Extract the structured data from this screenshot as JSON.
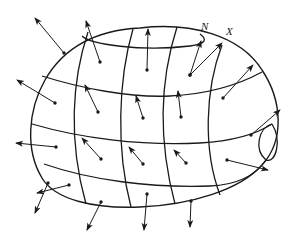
{
  "figure": {
    "type": "surface-normal-field",
    "stroke_color": "#1a1a1a",
    "background": "#ffffff"
  },
  "labels": {
    "normal": "N",
    "vector": "X"
  },
  "label_positions": {
    "normal": {
      "x": 206,
      "y": 29
    },
    "vector": {
      "x": 227,
      "y": 33
    }
  },
  "surface": {
    "outline": "M 98 150 C 98 110, 120 45, 190 33 C 240 28, 260 60, 270 95 C 285 130, 270 165, 225 186 C 200 196, 150 210, 110 205 C 70 200, 30 180, 38 150 C 40 125, 70 75, 98 50",
    "latitude_lines": [
      "M 128 35 C 170 22, 240 28, 260 55",
      "M 42 80 C 90 90, 130 100, 170 96 C 210 92, 240 80, 262 70",
      "M 34 128 C 80 140, 140 150, 200 145 C 235 142, 260 130, 270 120",
      "M 45 176 C 100 186, 160 190, 215 186 C 240 183, 255 175, 262 160"
    ],
    "cap_top": "M 128 35 C 120 48, 160 52, 200 45 C 225 40, 230 30, 215 26",
    "cap_right": "M 272 120 C 258 125, 255 150, 265 162 C 275 168, 282 140, 272 120"
  },
  "normals": [
    {
      "from": [
        64,
        53
      ],
      "to": [
        35,
        18
      ]
    },
    {
      "from": [
        100,
        62
      ],
      "to": [
        86,
        21
      ]
    },
    {
      "from": [
        190,
        75
      ],
      "to": [
        201,
        41
      ],
      "label_ref": "normal"
    },
    {
      "from": [
        190,
        75
      ],
      "to": [
        222,
        43
      ],
      "label_ref": "vector"
    },
    {
      "from": [
        147,
        70
      ],
      "to": [
        148,
        29
      ]
    },
    {
      "from": [
        55,
        103
      ],
      "to": [
        17,
        80
      ]
    },
    {
      "from": [
        98,
        112
      ],
      "to": [
        85,
        85
      ]
    },
    {
      "from": [
        143,
        118
      ],
      "to": [
        136,
        96
      ]
    },
    {
      "from": [
        181,
        117
      ],
      "to": [
        178,
        91
      ]
    },
    {
      "from": [
        223,
        98
      ],
      "to": [
        253,
        65
      ]
    },
    {
      "from": [
        56,
        147
      ],
      "to": [
        16,
        143
      ]
    },
    {
      "from": [
        101,
        159
      ],
      "to": [
        82,
        138
      ]
    },
    {
      "from": [
        143,
        164
      ],
      "to": [
        129,
        147
      ]
    },
    {
      "from": [
        186,
        163
      ],
      "to": [
        174,
        150
      ]
    },
    {
      "from": [
        251,
        135
      ],
      "to": [
        280,
        110
      ]
    },
    {
      "from": [
        227,
        160
      ],
      "to": [
        268,
        170
      ]
    },
    {
      "from": [
        69,
        185
      ],
      "to": [
        37,
        193
      ]
    },
    {
      "from": [
        101,
        202
      ],
      "to": [
        87,
        230
      ]
    },
    {
      "from": [
        147,
        194
      ],
      "to": [
        144,
        230
      ]
    },
    {
      "from": [
        191,
        201
      ],
      "to": [
        190,
        227
      ]
    },
    {
      "from": [
        48,
        183
      ],
      "to": [
        35,
        213
      ]
    }
  ]
}
